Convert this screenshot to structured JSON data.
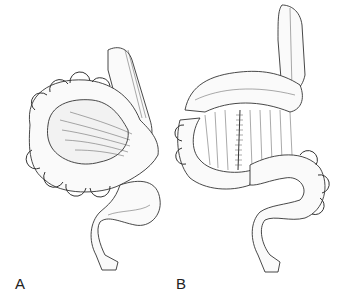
{
  "figure": {
    "panels": [
      {
        "label": "A",
        "subject": "colon-illustration-before"
      },
      {
        "label": "B",
        "subject": "colon-illustration-after-with-suture"
      }
    ],
    "colors": {
      "background": "#ffffff",
      "line": "#333333",
      "label": "#222222"
    }
  }
}
